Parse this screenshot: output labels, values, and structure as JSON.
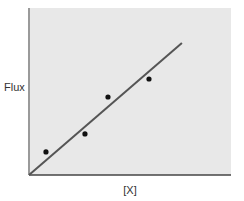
{
  "chart_data": {
    "type": "scatter",
    "title": "",
    "xlabel": "[X]",
    "ylabel": "Flux",
    "xlim": [
      0,
      10
    ],
    "ylim": [
      0,
      10
    ],
    "grid": false,
    "legend": null,
    "axis_ticks": "none",
    "series": [
      {
        "name": "data points",
        "kind": "scatter",
        "x": [
          0.84,
          2.77,
          3.91,
          5.94
        ],
        "y": [
          1.38,
          2.46,
          4.67,
          5.75
        ]
      },
      {
        "name": "linear fit",
        "kind": "line",
        "x": [
          0,
          7.57
        ],
        "y": [
          0,
          7.9
        ]
      }
    ],
    "colors": {
      "plot_background": "#e8e8e8",
      "line": "#555555",
      "points": "#111111",
      "axis": "#444444"
    }
  },
  "labels": {
    "x_axis": "[X]",
    "y_axis": "Flux"
  }
}
